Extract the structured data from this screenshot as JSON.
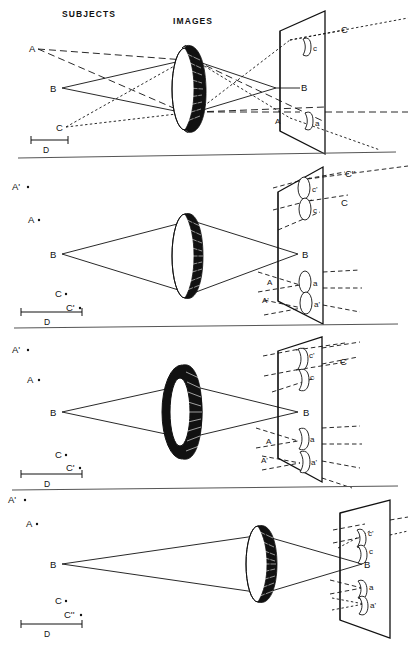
{
  "figure": {
    "headers": {
      "subjects": "SUBJECTS",
      "images": "IMAGES"
    },
    "scale_label": "D",
    "ink_color": "#111111",
    "background": "#ffffff"
  },
  "panels": [
    {
      "id": "panel-1",
      "lens_type": "full-aperture-lens",
      "subject_labels": [
        "A",
        "B",
        "C"
      ],
      "image_labels": [
        "c",
        "B",
        "a"
      ],
      "ray_labels_right": [
        "C"
      ],
      "screen_labels": [
        "A"
      ],
      "scale_label": "D",
      "ray_styles": {
        "A": "long-dash",
        "B": "solid",
        "C": "short-dash"
      }
    },
    {
      "id": "panel-2",
      "lens_type": "full-aperture-lens",
      "subject_labels": [
        "A'",
        "A",
        "B",
        "C",
        "C'"
      ],
      "image_labels": [
        "c'",
        "c",
        "B",
        "a",
        "a'"
      ],
      "ray_labels_right": [
        "C''",
        "C"
      ],
      "screen_labels": [
        "A",
        "A'"
      ],
      "scale_label": "D",
      "ray_styles": {
        "A": "long-dash",
        "B": "solid",
        "C": "short-dash"
      }
    },
    {
      "id": "panel-3",
      "lens_type": "annular-ring-lens",
      "subject_labels": [
        "A'",
        "A",
        "B",
        "C",
        "C'"
      ],
      "image_labels": [
        "c'",
        "c",
        "B",
        "a",
        "a'"
      ],
      "ray_labels_right": [
        "C"
      ],
      "screen_labels": [
        "A",
        "A'"
      ],
      "scale_label": "D",
      "ray_styles": {
        "A": "long-dash",
        "B": "solid",
        "C": "short-dash"
      }
    },
    {
      "id": "panel-4",
      "lens_type": "full-aperture-lens-shifted",
      "subject_labels": [
        "A'",
        "A",
        "B",
        "C",
        "C''"
      ],
      "image_labels": [
        "c'",
        "c",
        "B",
        "a",
        "a'"
      ],
      "ray_labels_right": [],
      "screen_labels": [],
      "scale_label": "D",
      "ray_styles": {
        "A": "long-dash",
        "B": "solid",
        "C": "short-dash"
      }
    }
  ]
}
